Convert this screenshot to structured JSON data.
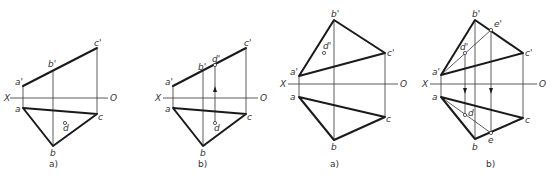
{
  "figure": {
    "axis_labels": {
      "x": "X",
      "o": "O"
    },
    "panels": [
      {
        "caption": "a)",
        "labels": {
          "a1": "a'",
          "b1": "b'",
          "c1": "c'",
          "a": "a",
          "b": "b",
          "c": "c",
          "d": "d"
        }
      },
      {
        "caption": "b)",
        "labels": {
          "a1": "a'",
          "b1": "b'",
          "c1": "c'",
          "d1": "d'",
          "a": "a",
          "b": "b",
          "c": "c",
          "d": "d"
        }
      },
      {
        "caption": "a)",
        "labels": {
          "a1": "a'",
          "b1": "b'",
          "c1": "c'",
          "d1": "d'",
          "a": "a",
          "b": "b",
          "c": "c"
        }
      },
      {
        "caption": "b)",
        "labels": {
          "a1": "a'",
          "b1": "b'",
          "c1": "c'",
          "d1": "d'",
          "e1": "e'",
          "a": "a",
          "b": "b",
          "c": "c",
          "d": "d",
          "e": "e"
        }
      }
    ]
  }
}
